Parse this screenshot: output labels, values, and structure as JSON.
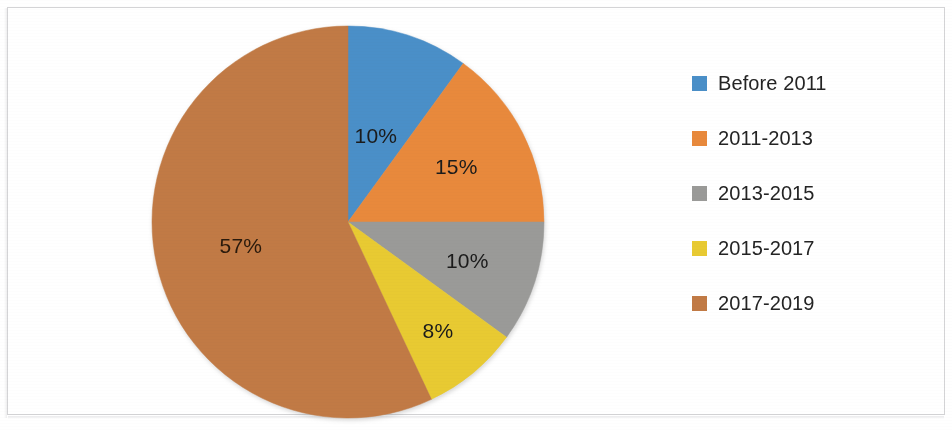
{
  "chart_data": {
    "type": "pie",
    "title": "",
    "subtitle": "",
    "xlabel": "",
    "ylabel": "",
    "grid": false,
    "legend_position": "right",
    "start_angle_deg": 0,
    "direction": "clockwise",
    "categories": [
      "Before 2011",
      "2011-2013",
      "2013-2015",
      "2015-2017",
      "2017-2019"
    ],
    "values": [
      10,
      15,
      10,
      8,
      57
    ],
    "value_unit": "%",
    "data_labels": [
      "10%",
      "15%",
      "10%",
      "8%",
      "57%"
    ],
    "colors": [
      "#4A8FC8",
      "#E8893C",
      "#9A9A98",
      "#E8CA32",
      "#C17A45"
    ],
    "slices": [
      {
        "label": "Before 2011",
        "value": 10,
        "data_label": "10%",
        "color": "#4A8FC8"
      },
      {
        "label": "2011-2013",
        "value": 15,
        "data_label": "15%",
        "color": "#E8893C"
      },
      {
        "label": "2013-2015",
        "value": 10,
        "data_label": "10%",
        "color": "#9A9A98"
      },
      {
        "label": "2015-2017",
        "value": 8,
        "data_label": "8%",
        "color": "#E8CA32"
      },
      {
        "label": "2017-2019",
        "value": 57,
        "data_label": "57%",
        "color": "#C17A45"
      }
    ]
  },
  "legend": {
    "items": [
      {
        "label": "Before 2011",
        "color": "#4A8FC8"
      },
      {
        "label": "2011-2013",
        "color": "#E8893C"
      },
      {
        "label": "2013-2015",
        "color": "#9A9A98"
      },
      {
        "label": "2015-2017",
        "color": "#E8CA32"
      },
      {
        "label": "2017-2019",
        "color": "#C17A45"
      }
    ]
  }
}
